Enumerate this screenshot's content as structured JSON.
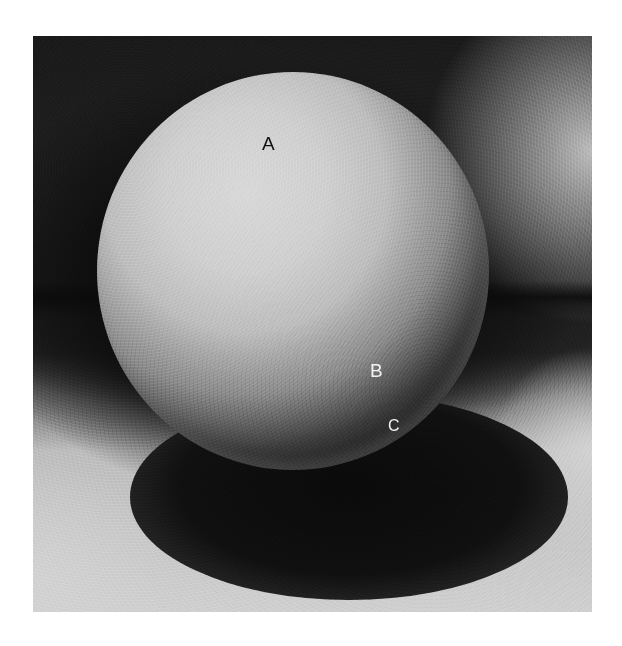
{
  "figure": {
    "labels": {
      "a": "A",
      "b": "B",
      "c": "C"
    },
    "colors": {
      "background_dark": "#151515",
      "surface_light": "#cfcfcf",
      "highlight": "#d8d8d8",
      "shadow": "#0a0a0a",
      "label_dark": "#111111",
      "label_light": "#f2f2f2"
    }
  }
}
